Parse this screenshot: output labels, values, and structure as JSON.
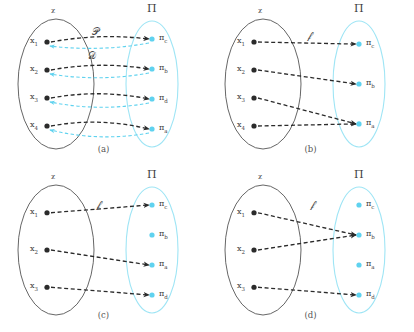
{
  "figure": {
    "width": 414,
    "height": 332,
    "background": "#ffffff",
    "colors": {
      "dark": "#2b2b2b",
      "dark_ellipse": "#555555",
      "cyan": "#5fd2ef",
      "cyan_ellipse": "#9fe5f5",
      "text": "#3d3d3d"
    }
  },
  "panels": [
    {
      "id": "a",
      "caption": "(a)",
      "domain_label": "ᵪ",
      "codomain_label": "Π",
      "map_labels": [
        {
          "name": "forward-map-label",
          "text": "𝒫",
          "x": 92,
          "y": 26
        },
        {
          "name": "backward-map-label",
          "text": "𝒟",
          "x": 88,
          "y": 50
        }
      ],
      "domain_nodes": [
        {
          "id": "x1",
          "label": "x",
          "sub": "1"
        },
        {
          "id": "x2",
          "label": "x",
          "sub": "2"
        },
        {
          "id": "x3",
          "label": "x",
          "sub": "3"
        },
        {
          "id": "x4",
          "label": "x",
          "sub": "4"
        }
      ],
      "codomain_nodes": [
        {
          "id": "pc",
          "label": "π",
          "sub": "c",
          "filled": true
        },
        {
          "id": "pb",
          "label": "π",
          "sub": "b",
          "filled": true
        },
        {
          "id": "pd",
          "label": "π",
          "sub": "d",
          "filled": true
        },
        {
          "id": "pa",
          "label": "π",
          "sub": "a",
          "filled": true
        }
      ],
      "edges_forward": [
        {
          "from": "x1",
          "to": "pc"
        },
        {
          "from": "x2",
          "to": "pb"
        },
        {
          "from": "x3",
          "to": "pd"
        },
        {
          "from": "x4",
          "to": "pa"
        }
      ],
      "edges_backward": [
        {
          "from": "pc",
          "to": "x1"
        },
        {
          "from": "pb",
          "to": "x2"
        },
        {
          "from": "pd",
          "to": "x3"
        },
        {
          "from": "pa",
          "to": "x4"
        }
      ]
    },
    {
      "id": "b",
      "caption": "(b)",
      "domain_label": "ᵪ",
      "codomain_label": "Π",
      "map_labels": [
        {
          "name": "map-label",
          "text": "𝒻",
          "x": 100,
          "y": 30
        }
      ],
      "domain_nodes": [
        {
          "id": "x1",
          "label": "x",
          "sub": "1"
        },
        {
          "id": "x2",
          "label": "x",
          "sub": "2"
        },
        {
          "id": "x3",
          "label": "x",
          "sub": "3"
        },
        {
          "id": "x4",
          "label": "x",
          "sub": "4"
        }
      ],
      "codomain_nodes": [
        {
          "id": "pc",
          "label": "π",
          "sub": "c",
          "filled": true
        },
        {
          "id": "pb",
          "label": "π",
          "sub": "b",
          "filled": true
        },
        {
          "id": "pa",
          "label": "π",
          "sub": "a",
          "filled": true
        }
      ],
      "edges_forward": [
        {
          "from": "x1",
          "to": "pc"
        },
        {
          "from": "x2",
          "to": "pb"
        },
        {
          "from": "x3",
          "to": "pa"
        },
        {
          "from": "x4",
          "to": "pa"
        }
      ],
      "edges_backward": []
    },
    {
      "id": "c",
      "caption": "(c)",
      "domain_label": "ᵪ",
      "codomain_label": "Π",
      "map_labels": [
        {
          "name": "map-label",
          "text": "𝒻",
          "x": 96,
          "y": 33
        }
      ],
      "domain_nodes": [
        {
          "id": "x1",
          "label": "x",
          "sub": "1"
        },
        {
          "id": "x2",
          "label": "x",
          "sub": "2"
        },
        {
          "id": "x3",
          "label": "x",
          "sub": "3"
        }
      ],
      "codomain_nodes": [
        {
          "id": "pc",
          "label": "π",
          "sub": "c",
          "filled": true
        },
        {
          "id": "pb",
          "label": "π",
          "sub": "b",
          "filled": true
        },
        {
          "id": "pa",
          "label": "π",
          "sub": "a",
          "filled": true
        },
        {
          "id": "pd",
          "label": "π",
          "sub": "d",
          "filled": true
        }
      ],
      "edges_forward": [
        {
          "from": "x1",
          "to": "pc"
        },
        {
          "from": "x2",
          "to": "pa"
        },
        {
          "from": "x3",
          "to": "pd"
        }
      ],
      "edges_backward": []
    },
    {
      "id": "d",
      "caption": "(d)",
      "domain_label": "ᵪ",
      "codomain_label": "Π",
      "map_labels": [
        {
          "name": "map-label",
          "text": "𝒻",
          "x": 103,
          "y": 33
        }
      ],
      "domain_nodes": [
        {
          "id": "x1",
          "label": "x",
          "sub": "1"
        },
        {
          "id": "x2",
          "label": "x",
          "sub": "2"
        },
        {
          "id": "x3",
          "label": "x",
          "sub": "3"
        }
      ],
      "codomain_nodes": [
        {
          "id": "pc",
          "label": "π",
          "sub": "c",
          "filled": true
        },
        {
          "id": "pb",
          "label": "π",
          "sub": "b",
          "filled": true
        },
        {
          "id": "pa",
          "label": "π",
          "sub": "a",
          "filled": true
        },
        {
          "id": "pd",
          "label": "π",
          "sub": "d",
          "filled": true
        }
      ],
      "edges_forward": [
        {
          "from": "x1",
          "to": "pb"
        },
        {
          "from": "x2",
          "to": "pb"
        },
        {
          "from": "x3",
          "to": "pd"
        }
      ],
      "edges_backward": []
    }
  ]
}
